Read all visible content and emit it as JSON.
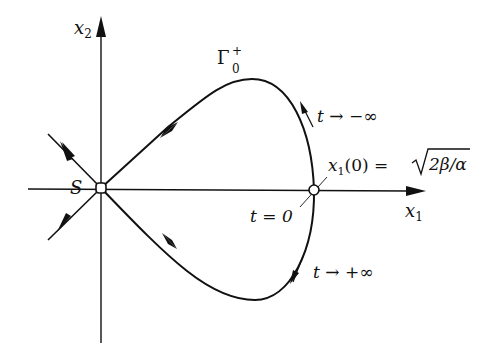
{
  "figure": {
    "type": "phase-portrait"
  },
  "axes": {
    "x_label": "x",
    "x_sub": "1",
    "y_label": "x",
    "y_sub": "2"
  },
  "points": {
    "saddle": {
      "label": "S"
    },
    "turning": {
      "label_t0": "t = 0"
    }
  },
  "curve": {
    "name": "Γ",
    "sub": "0",
    "sup": "+"
  },
  "annotations": {
    "t_minus": "t → −∞",
    "t_plus": "t → +∞",
    "x1_zero_lhs": "x",
    "x1_zero_sub": "1",
    "x1_zero_rest": "(0) = ",
    "sqrt_body": "2β/α"
  },
  "colors": {
    "ink": "#111111",
    "background": "#ffffff"
  }
}
